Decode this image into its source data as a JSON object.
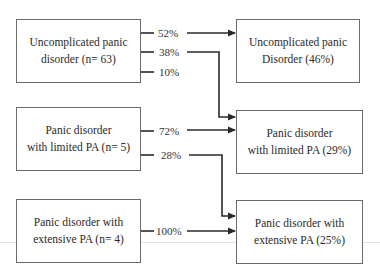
{
  "diagram": {
    "type": "flow",
    "source_boxes": [
      {
        "id": "src1",
        "line1": "Uncomplicated panic",
        "line2": "disorder (n= 63)"
      },
      {
        "id": "src2",
        "line1": "Panic disorder",
        "line2": "with limited PA (n= 5)"
      },
      {
        "id": "src3",
        "line1": "Panic disorder with",
        "line2": "extensive PA (n= 4)"
      }
    ],
    "target_boxes": [
      {
        "id": "tgt1",
        "line1": "Uncomplicated panic",
        "line2": "Disorder (46%)"
      },
      {
        "id": "tgt2",
        "line1": "Panic disorder",
        "line2": "with limited PA (29%)"
      },
      {
        "id": "tgt3",
        "line1": "Panic disorder with",
        "line2": "extensive PA (25%)"
      }
    ],
    "transitions": [
      {
        "from": "src1",
        "to": "tgt1",
        "label": "52%"
      },
      {
        "from": "src1",
        "to": "tgt2",
        "label": "38%"
      },
      {
        "from": "src1",
        "to": null,
        "label": "10%"
      },
      {
        "from": "src2",
        "to": "tgt2",
        "label": "72%"
      },
      {
        "from": "src2",
        "to": "tgt3",
        "label": "28%"
      },
      {
        "from": "src3",
        "to": "tgt3",
        "label": "100%"
      }
    ],
    "colors": {
      "line": "#2a2a2a",
      "box_border": "#6a6a6a"
    }
  }
}
